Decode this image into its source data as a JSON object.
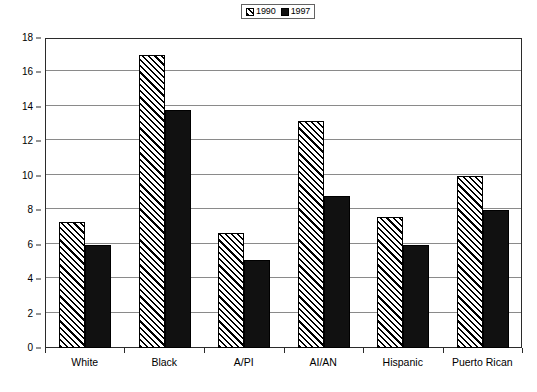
{
  "chart_data": {
    "type": "bar",
    "title": "",
    "subtitle": "",
    "xlabel": "",
    "ylabel": "",
    "ylim": [
      0,
      18
    ],
    "ytick_step": 2,
    "yticks": [
      0,
      2,
      4,
      6,
      8,
      10,
      12,
      14,
      16,
      18
    ],
    "grid": true,
    "legend_position": "top-center",
    "categories": [
      "White",
      "Black",
      "A/PI",
      "AI/AN",
      "Hispanic",
      "Puerto Rican"
    ],
    "series": [
      {
        "name": "1990",
        "fill": "hatched-diagonal",
        "color": "#ffffff",
        "values": [
          7.3,
          17.0,
          6.7,
          13.2,
          7.6,
          10.0
        ]
      },
      {
        "name": "1997",
        "fill": "solid",
        "color": "#111111",
        "values": [
          6.0,
          13.8,
          5.1,
          8.8,
          6.0,
          8.0
        ]
      }
    ]
  },
  "legend": {
    "items": [
      {
        "label": "1990",
        "swatch": "hatched-swatch-icon"
      },
      {
        "label": "1997",
        "swatch": "solid-swatch-icon"
      }
    ]
  },
  "axes": {
    "y_tick_labels": [
      "18",
      "16",
      "14",
      "12",
      "10",
      "8",
      "6",
      "4",
      "2",
      "0"
    ],
    "x_tick_labels": [
      "White",
      "Black",
      "A/PI",
      "AI/AN",
      "Hispanic",
      "Puerto Rican"
    ]
  },
  "colors": {
    "plot_border": "#2b2b2b",
    "gridline": "#8a8a8a",
    "bar_outline": "#000000",
    "series_1997": "#111111",
    "background": "#ffffff"
  }
}
